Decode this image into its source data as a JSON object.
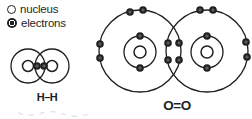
{
  "colors": {
    "ink": "#1f1f1f",
    "background": "#ffffff",
    "electron_core": "#5a5a5a",
    "faint_marks": "#e2e4e7"
  },
  "legend": {
    "items": [
      {
        "icon": "nucleus-icon",
        "label": "nucleus"
      },
      {
        "icon": "electron-icon",
        "label": "electrons"
      }
    ]
  },
  "canvas": {
    "width": 252,
    "height": 119
  },
  "electron_radius": 3.8,
  "electron_core_radius": 1.7,
  "molecules": [
    {
      "name": "hydrogen-molecule",
      "label": "H–H",
      "shells": [
        {
          "cx": 28,
          "cy": 66,
          "r": 17
        },
        {
          "cx": 52,
          "cy": 66,
          "r": 17
        }
      ],
      "nuclei": [
        {
          "cx": 28,
          "cy": 66,
          "r": 5.5
        },
        {
          "cx": 52,
          "cy": 66,
          "r": 5.5
        }
      ],
      "electrons": [
        {
          "cx": 37,
          "cy": 66
        },
        {
          "cx": 44,
          "cy": 66
        }
      ]
    },
    {
      "name": "oxygen-molecule",
      "label": "O=O",
      "shells": [
        {
          "cx": 140,
          "cy": 51,
          "r": 41
        },
        {
          "cx": 207,
          "cy": 51,
          "r": 41
        },
        {
          "cx": 140,
          "cy": 52,
          "r": 16
        },
        {
          "cx": 207,
          "cy": 52,
          "r": 16
        }
      ],
      "nuclei": [
        {
          "cx": 140,
          "cy": 52,
          "r": 6
        },
        {
          "cx": 207,
          "cy": 52,
          "r": 6
        }
      ],
      "electrons": [
        {
          "cx": 140,
          "cy": 36
        },
        {
          "cx": 140,
          "cy": 68
        },
        {
          "cx": 207,
          "cy": 36
        },
        {
          "cx": 207,
          "cy": 68
        },
        {
          "cx": 130,
          "cy": 12
        },
        {
          "cx": 143,
          "cy": 10
        },
        {
          "cx": 200,
          "cy": 10
        },
        {
          "cx": 213,
          "cy": 10
        },
        {
          "cx": 100,
          "cy": 44
        },
        {
          "cx": 100,
          "cy": 58
        },
        {
          "cx": 246,
          "cy": 42
        },
        {
          "cx": 247,
          "cy": 57
        },
        {
          "cx": 168,
          "cy": 43
        },
        {
          "cx": 179,
          "cy": 43
        },
        {
          "cx": 168,
          "cy": 60
        },
        {
          "cx": 179,
          "cy": 60
        }
      ]
    }
  ]
}
